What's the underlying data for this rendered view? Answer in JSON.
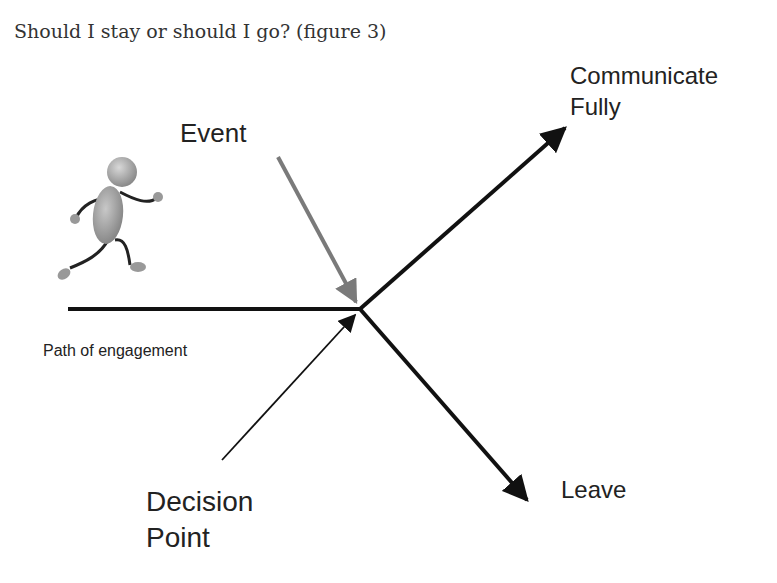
{
  "caption": "Should I stay or should I go? (figure 3)",
  "labels": {
    "event": "Event",
    "communicate_line1": "Communicate",
    "communicate_line2": "Fully",
    "path": "Path of engagement",
    "leave": "Leave",
    "decision_line1": "Decision",
    "decision_line2": "Point"
  },
  "colors": {
    "line": "#111111",
    "event_arrow": "#7a7a7a",
    "figure_gray": "#9a9a9a"
  },
  "icons": {
    "runner": "running-stick-figure-icon"
  }
}
